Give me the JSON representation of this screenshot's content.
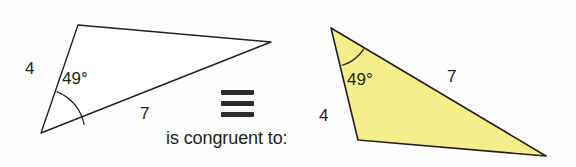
{
  "diagram": {
    "relation_text": "is congruent to:",
    "relation_symbol": "≡",
    "background_color": "#fefefe",
    "outline_color": "#231f20",
    "label_color": "#231f20",
    "left_triangle": {
      "name": "unshaded-triangle",
      "fill_color": "#ffffff",
      "stroke_color": "#231f20",
      "vertices": [
        [
          78,
          25
        ],
        [
          271,
          42
        ],
        [
          41,
          133
        ]
      ],
      "angle_label": "49°",
      "angle_vertex": [
        41,
        133
      ],
      "side_labels": [
        {
          "text": "4",
          "x": 30,
          "y": 68
        },
        {
          "text": "7",
          "x": 145,
          "y": 113
        }
      ]
    },
    "right_triangle": {
      "name": "shaded-triangle",
      "fill_color": "#f4ef8a",
      "stroke_color": "#231f20",
      "vertices": [
        [
          331,
          28
        ],
        [
          546,
          156
        ],
        [
          358,
          140
        ]
      ],
      "angle_label": "49°",
      "angle_vertex": [
        331,
        28
      ],
      "side_labels": [
        {
          "text": "7",
          "x": 452,
          "y": 76
        },
        {
          "text": "4",
          "x": 324,
          "y": 115
        }
      ]
    }
  }
}
